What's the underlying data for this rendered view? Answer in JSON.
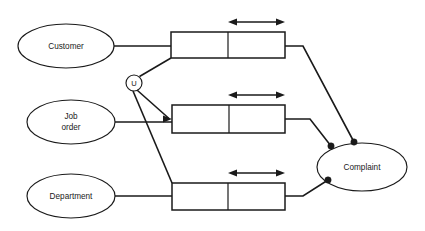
{
  "diagram": {
    "type": "entity-relationship-diagram",
    "colors": {
      "stroke": "#1a1a1a",
      "fill": "#ffffff",
      "background": "#ffffff"
    },
    "entities": [
      {
        "id": "customer",
        "label": "Customer",
        "label_lines": [
          "Customer"
        ],
        "cx": 66,
        "cy": 46,
        "rx": 48,
        "ry": 22
      },
      {
        "id": "job_order",
        "label": "Job order",
        "label_lines": [
          "Job",
          "order"
        ],
        "line1": "Job",
        "line2": "order",
        "cx": 71,
        "cy": 122,
        "rx": 44,
        "ry": 22
      },
      {
        "id": "department",
        "label": "Department",
        "label_lines": [
          "Department"
        ],
        "cx": 71,
        "cy": 196,
        "rx": 44,
        "ry": 22
      },
      {
        "id": "complaint",
        "label": "Complaint",
        "label_lines": [
          "Complaint"
        ],
        "cx": 362,
        "cy": 167,
        "rx": 45,
        "ry": 24
      }
    ],
    "union_node": {
      "id": "union-u",
      "label": "U",
      "cx": 134,
      "cy": 83,
      "r": 8
    },
    "relationship_boxes": [
      {
        "id": "relationship-box-top",
        "x": 171,
        "y": 32,
        "width": 114,
        "height": 26,
        "divider_x": 228,
        "arrow": {
          "x1": 228,
          "x2": 285,
          "y": 22
        }
      },
      {
        "id": "relationship-box-middle",
        "x": 172,
        "y": 105,
        "width": 113,
        "height": 28,
        "divider_x": 229,
        "arrow": {
          "x1": 228,
          "x2": 285,
          "y": 95
        }
      },
      {
        "id": "relationship-box-bottom",
        "x": 172,
        "y": 183,
        "width": 113,
        "height": 27,
        "divider_x": 228,
        "arrow": {
          "x1": 228,
          "x2": 285,
          "y": 173
        }
      }
    ],
    "connection_dots": [
      {
        "id": "dot-top",
        "cx": 354,
        "cy": 142,
        "r": 3.2
      },
      {
        "id": "dot-middle",
        "cx": 331,
        "cy": 146,
        "r": 3.2
      },
      {
        "id": "dot-bottom",
        "cx": 328,
        "cy": 180,
        "r": 3.2
      }
    ],
    "connectors": [
      {
        "id": "customer-to-top-box",
        "points": "114,46 171,46"
      },
      {
        "id": "joborder-to-middle-box",
        "points": "115,122 172,122"
      },
      {
        "id": "department-to-bottom-box",
        "points": "115,196 172,196"
      },
      {
        "id": "union-to-top-box",
        "points": "139,76 171,58"
      },
      {
        "id": "union-to-middle-box",
        "points": "136,91 170,119"
      },
      {
        "id": "union-to-bottom-box",
        "points": "134,91 172,183"
      },
      {
        "id": "top-box-to-complaint",
        "points": "285,46 303,46 354,142"
      },
      {
        "id": "middle-box-to-complaint",
        "points": "285,119 310,119 331,146"
      },
      {
        "id": "bottom-box-to-complaint",
        "points": "285,196 303,196 328,180"
      }
    ]
  }
}
